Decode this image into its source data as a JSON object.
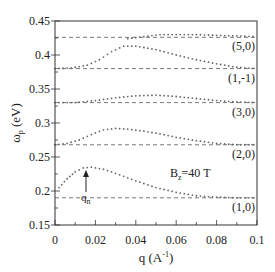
{
  "chart_data": {
    "type": "line",
    "title": "",
    "xlabel": "q (A⁻¹)",
    "ylabel": "ωp (eV)",
    "xlim": [
      0,
      0.1
    ],
    "ylim": [
      0.15,
      0.45
    ],
    "x_ticks": [
      "0",
      "0.02",
      "0.04",
      "0.06",
      "0.08",
      "0.1"
    ],
    "y_ticks": [
      "0.15",
      "0.2",
      "0.25",
      "0.3",
      "0.35",
      "0.4",
      "0.45"
    ],
    "grid": false,
    "annotations": [
      "B₂=40 T",
      "qₙ"
    ],
    "reference_lines": [
      {
        "label": "(1,0)",
        "y": 0.19
      },
      {
        "label": "(2,0)",
        "y": 0.268
      },
      {
        "label": "(3,0)",
        "y": 0.33
      },
      {
        "label": "(1,-1)",
        "y": 0.38
      },
      {
        "label": "(5,0)",
        "y": 0.426
      }
    ],
    "series": [
      {
        "name": "(1,0) branch",
        "x": [
          0.002,
          0.006,
          0.01,
          0.014,
          0.018,
          0.024,
          0.03,
          0.04,
          0.05,
          0.06,
          0.07,
          0.08,
          0.09,
          0.1
        ],
        "values": [
          0.205,
          0.218,
          0.228,
          0.234,
          0.235,
          0.232,
          0.226,
          0.215,
          0.205,
          0.198,
          0.193,
          0.191,
          0.19,
          0.19
        ]
      },
      {
        "name": "(2,0) branch",
        "x": [
          0.0,
          0.006,
          0.012,
          0.018,
          0.024,
          0.03,
          0.036,
          0.044,
          0.052,
          0.06,
          0.07,
          0.08,
          0.09,
          0.1
        ],
        "values": [
          0.268,
          0.27,
          0.275,
          0.283,
          0.29,
          0.292,
          0.291,
          0.288,
          0.284,
          0.279,
          0.274,
          0.27,
          0.268,
          0.268
        ]
      },
      {
        "name": "(3,0) branch",
        "x": [
          0.0,
          0.01,
          0.02,
          0.03,
          0.04,
          0.05,
          0.06,
          0.07,
          0.08,
          0.09,
          0.1
        ],
        "values": [
          0.33,
          0.33,
          0.333,
          0.337,
          0.34,
          0.341,
          0.339,
          0.336,
          0.333,
          0.331,
          0.33
        ]
      },
      {
        "name": "(1,-1) branch",
        "x": [
          0.0,
          0.008,
          0.016,
          0.022,
          0.028,
          0.034,
          0.04,
          0.05,
          0.06,
          0.07,
          0.08,
          0.09,
          0.1
        ],
        "values": [
          0.38,
          0.381,
          0.385,
          0.393,
          0.405,
          0.413,
          0.413,
          0.408,
          0.4,
          0.393,
          0.387,
          0.382,
          0.38
        ]
      },
      {
        "name": "(5,0) branch",
        "x": [
          0.036,
          0.044,
          0.052,
          0.06,
          0.07,
          0.08,
          0.09,
          0.1
        ],
        "values": [
          0.424,
          0.427,
          0.43,
          0.43,
          0.43,
          0.429,
          0.428,
          0.427
        ]
      }
    ]
  },
  "labels": {
    "ylabel_main": "ω",
    "ylabel_sub": "p",
    "ylabel_unit": " (eV)",
    "xlabel": "q (A",
    "xlabel_sup": "-1",
    "xlabel_end": ")",
    "field_B": "B",
    "field_sub": "z",
    "field_rest": "=40 T",
    "qn": "q",
    "qn_sub": "n"
  }
}
